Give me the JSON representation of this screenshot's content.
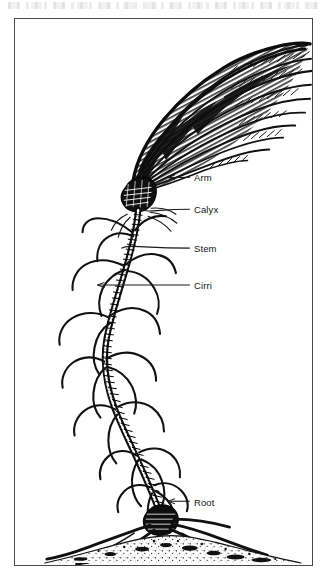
{
  "figure": {
    "kind": "scientific-engraving",
    "border_color": "#4a4a4a",
    "ink_color": "#111111",
    "background_color": "#ffffff",
    "scan_artifact_text": ""
  },
  "labels": [
    {
      "id": "arm",
      "text": "Arm",
      "x": 193,
      "y": 172,
      "leader_from_x": 168,
      "leader_to_x": 190,
      "leader_y": 177,
      "has_arrow": true
    },
    {
      "id": "calyx",
      "text": "Calyx",
      "x": 193,
      "y": 204,
      "leader_from_x": 142,
      "leader_to_x": 190,
      "leader_y": 209,
      "has_arrow": false
    },
    {
      "id": "stem",
      "text": "Stem",
      "x": 193,
      "y": 243,
      "leader_from_x": 121,
      "leader_to_x": 190,
      "leader_y": 248,
      "has_arrow": false
    },
    {
      "id": "cirri",
      "text": "Cirri",
      "x": 193,
      "y": 280,
      "leader_from_x": 97,
      "leader_to_x": 190,
      "leader_y": 285,
      "has_arrow": true
    },
    {
      "id": "root",
      "text": "Root",
      "x": 193,
      "y": 497,
      "leader_from_x": 168,
      "leader_to_x": 190,
      "leader_y": 502,
      "has_arrow": true
    }
  ]
}
